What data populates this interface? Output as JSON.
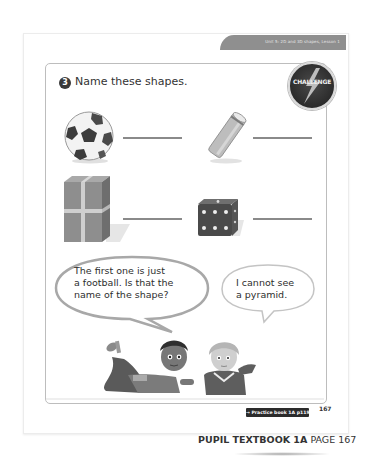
{
  "header": {
    "lesson": "Unit 5: 2D and 3D shapes, Lesson 1"
  },
  "question": {
    "number": "3",
    "prompt": "Name these shapes."
  },
  "challenge_badge": {
    "label": "CHALLENGE"
  },
  "shapes": [
    {
      "name": "football",
      "icon": "football-icon"
    },
    {
      "name": "tube",
      "icon": "cylinder-tube-icon"
    },
    {
      "name": "gift box",
      "icon": "cuboid-box-icon"
    },
    {
      "name": "dice",
      "icon": "cube-dice-icon"
    }
  ],
  "speech_bubbles": [
    {
      "lines": [
        "The first one is just",
        "a football. Is that the",
        "name of the shape?"
      ]
    },
    {
      "lines": [
        "I cannot see",
        "a pyramid."
      ]
    }
  ],
  "footer": {
    "practice_link": "→ Practice book 1A p119",
    "page_number": "167",
    "book_label": "PUPIL TEXTBOOK 1A",
    "page_label": "PAGE 167"
  },
  "colors": {
    "header_band": "#8f8f8f",
    "badge_dark": "#2b2b2b",
    "text": "#333333"
  }
}
